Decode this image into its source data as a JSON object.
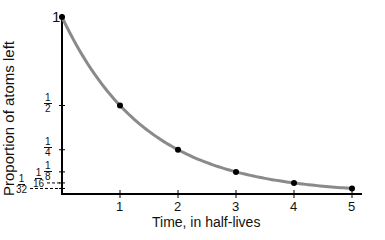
{
  "chart_data": {
    "type": "line",
    "title": "",
    "xlabel": "Time, in half-lives",
    "ylabel": "Proportion of atoms left",
    "x": [
      0,
      1,
      2,
      3,
      4,
      5
    ],
    "series": [
      {
        "name": "Proportion of atoms left",
        "values": [
          1,
          0.5,
          0.25,
          0.125,
          0.0625,
          0.03125
        ]
      }
    ],
    "x_ticks": [
      "1",
      "2",
      "3",
      "4",
      "5"
    ],
    "y_ticks": [
      {
        "label": "1",
        "value": 1
      },
      {
        "label": "1/2",
        "num": "1",
        "den": "2",
        "value": 0.5
      },
      {
        "label": "1/4",
        "num": "1",
        "den": "4",
        "value": 0.25
      },
      {
        "label": "1/8",
        "num": "1",
        "den": "8",
        "value": 0.125
      },
      {
        "label": "1/16",
        "num": "1",
        "den": "16",
        "value": 0.0625
      },
      {
        "label": "1/32",
        "num": "1",
        "den": "32",
        "value": 0.03125
      }
    ],
    "xlim": [
      0,
      5
    ],
    "ylim": [
      0,
      1
    ],
    "grid": false,
    "legend": "none",
    "colors": {
      "curve": "#8a8a8a",
      "points": "#000000",
      "axes": "#000000"
    }
  }
}
